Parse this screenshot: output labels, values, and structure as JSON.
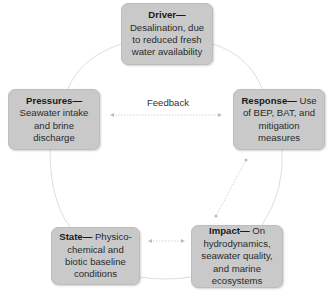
{
  "diagram": {
    "type": "DPSIR cycle",
    "nodes": [
      {
        "id": "driver",
        "title": "Driver—",
        "text": "Desalination, due to reduced fresh water availability"
      },
      {
        "id": "pressures",
        "title": "Pressures—",
        "text": "Seawater intake and brine discharge"
      },
      {
        "id": "response",
        "title": "Response—",
        "text": " Use of BEP, BAT, and mitigation measures"
      },
      {
        "id": "state",
        "title": "State—",
        "text": " Physico-chemical and biotic baseline conditions"
      },
      {
        "id": "impact",
        "title": "Impact—",
        "text": " On hydrodynamics, seawater quality, and marine ecosystems"
      }
    ],
    "edges": [
      {
        "from": "driver",
        "to": "pressures",
        "style": "curve"
      },
      {
        "from": "pressures",
        "to": "state",
        "style": "curve"
      },
      {
        "from": "state",
        "to": "impact",
        "style": "curve"
      },
      {
        "from": "impact",
        "to": "response",
        "style": "curve"
      },
      {
        "from": "response",
        "to": "driver",
        "style": "curve"
      },
      {
        "from": "pressures",
        "to": "response",
        "style": "dotted-double-arrow",
        "label": "Feedback"
      },
      {
        "from": "response",
        "to": "impact",
        "style": "dotted-double-arrow"
      },
      {
        "from": "state",
        "to": "impact",
        "style": "dotted-double-arrow"
      }
    ],
    "feedback_label": "Feedback",
    "colors": {
      "box_fill": "#c9c9c9",
      "box_border": "#bdbdbd",
      "connector": "#dedede",
      "arrow": "#cfcfcf",
      "text": "#2a2a2a"
    }
  }
}
